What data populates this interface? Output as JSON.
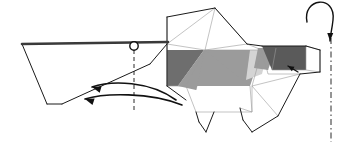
{
  "figure": {
    "kind": "origami-folding-step-diagram",
    "background_color": "#ffffff",
    "line_color": "#1a1a1a",
    "thin_line_color": "#8a8a8a",
    "canvas": {
      "width": 338,
      "height": 142
    }
  },
  "palette": {
    "paper_front": "#ffffff",
    "paper_shade_light": "#d4d4d4",
    "paper_shade_mid": "#9b9b9b",
    "paper_shade_dark": "#6e6e6e",
    "paper_shade_darkest": "#5a5a5a",
    "outline": "#1a1a1a",
    "crease_thin": "#9a9a9a",
    "arrow": "#111111"
  },
  "parts": {
    "tail_flap": {
      "name": "tail-flap",
      "fill": "#ffffff",
      "points": "22,44 160,42 150,64 62,104 47,104"
    },
    "tail_top_edge": {
      "name": "tail-top-edge",
      "points": "22,44 168,42"
    },
    "body_upper_fan": {
      "name": "body-upper-fan",
      "fill": "#ffffff",
      "points": "167,44 167,17 215,8 247,44"
    },
    "body_panel_left_dark": {
      "name": "body-panel-left-dark",
      "fill": "#6e6e6e",
      "points": "167,50 204,50 178,86 167,86"
    },
    "body_panel_left_mid": {
      "name": "body-panel-left-mid",
      "fill": "#9b9b9b",
      "points": "178,86 204,50 208,50 196,90"
    },
    "body_panel_center_mid": {
      "name": "body-panel-center-mid",
      "fill": "#9b9b9b",
      "points": "206,50 262,50 250,86 186,86"
    },
    "body_panel_right_light": {
      "name": "body-panel-right-light",
      "fill": "#d4d4d4",
      "points": "250,50 268,50 262,74 246,80"
    },
    "head_dark_trapezoid": {
      "name": "head-dark-trapezoid",
      "fill": "#5a5a5a",
      "points": "262,46 306,46 306,70 272,70"
    },
    "snout_mid": {
      "name": "snout-mid",
      "fill": "#9b9b9b",
      "points": "258,48 276,48 268,70 254,68"
    },
    "head_white_panel": {
      "name": "head-white-panel",
      "fill": "#ffffff",
      "points": "306,44 320,50 320,72 300,74"
    },
    "lower_body": {
      "name": "lower-body",
      "fill": "#ffffff",
      "points": "167,86 252,86 252,112 196,112 186,100"
    },
    "rear_leg": {
      "name": "rear-leg",
      "fill": "#ffffff",
      "points": "196,112 214,112 206,132 199,122"
    },
    "front_leg": {
      "name": "front-leg",
      "fill": "#ffffff",
      "points": "240,108 258,108 252,132 243,120"
    },
    "front_haunch": {
      "name": "front-haunch",
      "fill": "#ffffff",
      "points": "252,86 300,74 278,116 252,112"
    }
  },
  "creases": {
    "name": "crease-lines",
    "segments": [
      "167,17 167,86",
      "167,44 215,8",
      "167,44 205,50",
      "215,8 205,50",
      "215,8 247,44",
      "205,50 247,44",
      "205,50 178,86",
      "205,50 196,90",
      "205,50 186,86",
      "205,50 250,86",
      "205,50 262,50",
      "247,44 262,50",
      "167,86 186,86",
      "186,86 196,112",
      "252,86 252,112",
      "252,86 262,50",
      "252,86 300,74",
      "252,86 278,116",
      "262,50 268,74",
      "268,74 300,74",
      "272,70 306,70",
      "306,46 306,70",
      "306,46 320,50",
      "306,70 320,72",
      "320,50 320,72",
      "250,86 252,112",
      "196,112 252,112",
      "240,108 252,112",
      "258,48 268,70",
      "276,48 272,70"
    ]
  },
  "outlines": {
    "name": "model-outline",
    "segments": [
      "22,44 168,42",
      "22,44 47,104",
      "47,104 62,104",
      "62,104 150,64",
      "150,64 167,44",
      "167,17 215,8",
      "215,8 247,44",
      "247,44 262,46",
      "262,46 306,46",
      "306,46 320,50",
      "320,50 320,72",
      "320,72 300,74",
      "300,74 278,116",
      "278,116 252,132",
      "252,132 243,120",
      "243,120 240,108",
      "214,112 206,132",
      "206,132 199,122",
      "199,122 196,112",
      "167,17 167,86",
      "167,86 186,100"
    ]
  },
  "markers": {
    "pivot_circle": {
      "name": "pivot-point-circle",
      "cx": 134,
      "cy": 46,
      "r": 4.2,
      "stroke": "#111111",
      "fill": "#ffffff"
    }
  },
  "guide_lines": {
    "vertical_dashed": {
      "name": "fold-axis-dashed-line",
      "style": "dashed",
      "x": 134,
      "y1": 50,
      "y2": 113
    },
    "vertical_dash_dot": {
      "name": "rotation-axis-dash-dot-line",
      "style": "dash-dot",
      "x": 331,
      "y1": 38,
      "y2": 142
    }
  },
  "arrows": {
    "fold_arrow_upper": {
      "name": "fold-arrow-upper",
      "direction": "right-to-left",
      "path": "M 176,100 C 150,81 112,80 92,87",
      "head_at": "92,87",
      "head_angle_deg": 196
    },
    "fold_arrow_lower": {
      "name": "fold-arrow-lower",
      "direction": "right-to-left",
      "path": "M 182,105 C 150,92 104,93 85,99",
      "head_at": "85,99",
      "head_angle_deg": 198
    },
    "rotate_arrow": {
      "name": "rotate-model-arrow",
      "direction": "clockwise-loop",
      "path": "M 307,22 C 302,-2 336,-6 333,20 C 332,30 330,36 330,41",
      "head_at": "330,41",
      "head_angle_deg": 92
    },
    "small_tuck_arrow": {
      "name": "small-tuck-arrow",
      "path": "M 298,72 L 288,66",
      "head_at": "288,66",
      "head_angle_deg": 211
    }
  }
}
